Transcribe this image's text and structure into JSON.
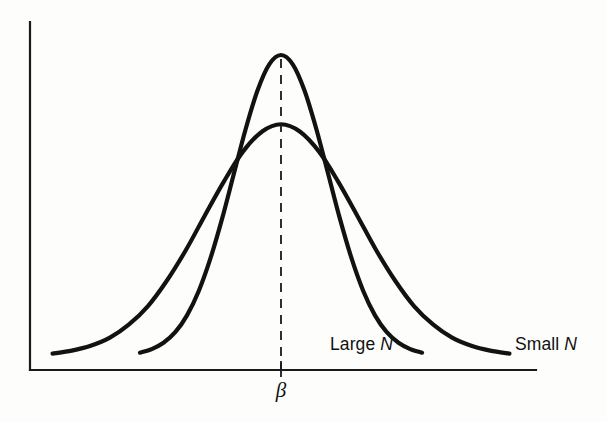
{
  "figure": {
    "title": "",
    "background_color": "#fdfdfc",
    "line_color": "#121212",
    "axis_color": "#1a1a1a"
  },
  "axes": {
    "x_axis_name": "x-axis",
    "y_axis_name": "y-axis",
    "x_tick_label": "β",
    "x_tick_label_name": "beta",
    "origin_px": {
      "x": 30,
      "y": 370
    },
    "x_end_px": 536,
    "y_top_px": 22
  },
  "annotations": {
    "center_dashed_line": "vertical dashed line at β",
    "labels": [
      {
        "prefix": "Large ",
        "symbol": "N",
        "name": "large-n-label",
        "x": 330,
        "y": 350
      },
      {
        "prefix": "Small ",
        "symbol": "N",
        "name": "small-n-label",
        "x": 515,
        "y": 350
      }
    ]
  },
  "chart_data": {
    "type": "line",
    "title": "",
    "xlabel": "",
    "ylabel": "",
    "grid": false,
    "legend_position": "inline-right",
    "x_tick_labels": [
      "β"
    ],
    "x_tick_values": [
      0
    ],
    "y_tick_labels": [],
    "annotations": [
      "vertical dashed line through the mode at β",
      "both sampling distributions are centered at β",
      "curves cross at approximately ±0.95 units from β"
    ],
    "series": [
      {
        "name": "Large N",
        "label": "Large N",
        "description": "Sampling distribution of the estimator for a large sample size: tall, narrow normal curve",
        "peak_height": 1.0,
        "std_dev": 1.0,
        "mean": 0,
        "x": [
          -3.0,
          -2.75,
          -2.5,
          -2.25,
          -2.0,
          -1.75,
          -1.5,
          -1.25,
          -1.0,
          -0.75,
          -0.5,
          -0.25,
          0,
          0.25,
          0.5,
          0.75,
          1.0,
          1.25,
          1.5,
          1.75,
          2.0,
          2.25,
          2.5,
          2.75,
          3.0
        ],
        "y": [
          0.011,
          0.023,
          0.044,
          0.079,
          0.135,
          0.216,
          0.325,
          0.458,
          0.607,
          0.755,
          0.882,
          0.969,
          1.0,
          0.969,
          0.882,
          0.755,
          0.607,
          0.458,
          0.325,
          0.216,
          0.135,
          0.079,
          0.044,
          0.023,
          0.011
        ]
      },
      {
        "name": "Small N",
        "label": "Small N",
        "description": "Sampling distribution of the estimator for a small sample size: short, wide normal curve",
        "peak_height": 0.77,
        "std_dev": 1.62,
        "mean": 0,
        "x": [
          -4.86,
          -4.45,
          -4.05,
          -3.64,
          -3.24,
          -2.83,
          -2.43,
          -2.02,
          -1.62,
          -1.21,
          -0.81,
          -0.4,
          0,
          0.4,
          0.81,
          1.21,
          1.62,
          2.02,
          2.43,
          2.83,
          3.24,
          3.64,
          4.05,
          4.45,
          4.86
        ],
        "y": [
          0.008,
          0.018,
          0.034,
          0.061,
          0.104,
          0.166,
          0.25,
          0.353,
          0.467,
          0.581,
          0.679,
          0.746,
          0.77,
          0.746,
          0.679,
          0.581,
          0.467,
          0.353,
          0.25,
          0.166,
          0.104,
          0.061,
          0.034,
          0.018,
          0.008
        ]
      }
    ],
    "xlim": [
      -5.4,
      5.4
    ],
    "ylim": [
      0,
      1.12
    ]
  }
}
